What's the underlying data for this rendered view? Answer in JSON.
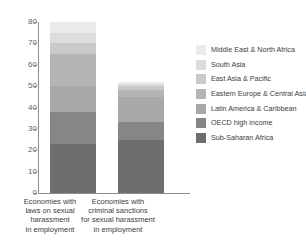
{
  "chart_data": {
    "type": "bar",
    "stacked": true,
    "title": "",
    "xlabel": "",
    "ylabel": "",
    "ylim": [
      0,
      80
    ],
    "ytick_labels": [
      "0",
      "10",
      "20",
      "30",
      "40",
      "50",
      "60",
      "70",
      "80"
    ],
    "ytick_values": [
      0,
      10,
      20,
      30,
      40,
      50,
      60,
      70,
      80
    ],
    "grid": false,
    "legend_position": "right",
    "categories": [
      "Economies with laws on sexual harassment in employment",
      "Economies with criminal sanctions for sexual harassment in employment"
    ],
    "category_lines": [
      [
        "Economies with",
        "laws on sexual",
        "harassment",
        "in employment"
      ],
      [
        "Economies with",
        "criminal sanctions",
        "for sexual harassment",
        "in employment"
      ]
    ],
    "series": [
      {
        "name": "Sub-Saharan Africa",
        "color": "#6e6e6e",
        "values": [
          23,
          25
        ]
      },
      {
        "name": "OECD high income",
        "color": "#868686",
        "values": [
          15,
          8
        ]
      },
      {
        "name": "Latin America & Caribbean",
        "color": "#a8a8a8",
        "values": [
          12,
          12
        ]
      },
      {
        "name": "Eastern Europe & Central Asia",
        "color": "#b4b4b4",
        "values": [
          15,
          3
        ]
      },
      {
        "name": "East Asia & Pacific",
        "color": "#c9c9c9",
        "values": [
          5,
          2
        ]
      },
      {
        "name": "South Asia",
        "color": "#dcdcdc",
        "values": [
          5,
          1
        ]
      },
      {
        "name": "Middle East & North Africa",
        "color": "#ebebeb",
        "values": [
          5,
          1
        ]
      }
    ],
    "totals": [
      80,
      52
    ],
    "legend_order": [
      "Middle East & North Africa",
      "South Asia",
      "East Asia & Pacific",
      "Eastern Europe & Central Asia",
      "Latin America & Caribbean",
      "OECD high income",
      "Sub-Saharan Africa"
    ]
  },
  "colors": {
    "axis": "#8e8e8e",
    "text": "#3d3d3d",
    "tick_text": "#5f5f5f",
    "background": "#ffffff"
  }
}
